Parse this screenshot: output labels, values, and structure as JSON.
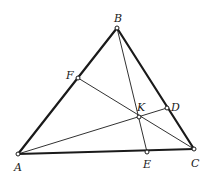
{
  "diagram": {
    "type": "triangle-cevians",
    "stroke_color": "#1a1a1a",
    "background": "#ffffff",
    "points": {
      "A": {
        "x": 18,
        "y": 154,
        "label": "A",
        "lx": 14,
        "ly": 171
      },
      "B": {
        "x": 117,
        "y": 28,
        "label": "B",
        "lx": 114,
        "ly": 22
      },
      "C": {
        "x": 194,
        "y": 149,
        "label": "C",
        "lx": 191,
        "ly": 167
      },
      "D": {
        "x": 167,
        "y": 108,
        "label": "D",
        "lx": 171,
        "ly": 111
      },
      "E": {
        "x": 147,
        "y": 152,
        "label": "E",
        "lx": 143,
        "ly": 168
      },
      "F": {
        "x": 78,
        "y": 78,
        "label": "F",
        "lx": 66,
        "ly": 79
      },
      "K": {
        "x": 139,
        "y": 117,
        "label": "K",
        "lx": 137,
        "ly": 111
      }
    },
    "triangle_sides": [
      [
        "A",
        "B"
      ],
      [
        "B",
        "C"
      ],
      [
        "C",
        "A"
      ]
    ],
    "cevians": [
      [
        "A",
        "D"
      ],
      [
        "B",
        "E"
      ],
      [
        "C",
        "F"
      ]
    ]
  }
}
